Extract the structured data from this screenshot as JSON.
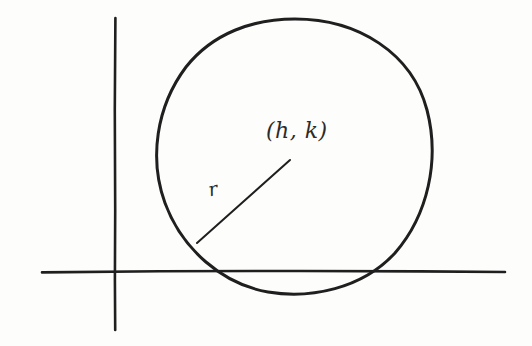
{
  "figure": {
    "background_color": "#fdfdfc",
    "ink_color": "#1f1f1f",
    "width": 532,
    "height": 346
  },
  "labels": {
    "center_point": "(h, k)",
    "radius": "r"
  },
  "chart_data": {
    "type": "scatter",
    "xlabel": "",
    "ylabel": "",
    "axes": {
      "x_axis": {
        "orientation": "horizontal",
        "y_pixel": 271,
        "x_start_pixel": 42,
        "x_end_pixel": 505
      },
      "y_axis": {
        "orientation": "vertical",
        "x_pixel": 115,
        "y_start_pixel": 18,
        "y_end_pixel": 330
      },
      "origin_pixel": [
        115,
        271
      ],
      "grid": false,
      "ticks": [],
      "tick_labels": []
    },
    "shapes": [
      {
        "kind": "circle",
        "center_pixel": [
          294,
          156
        ],
        "radius_pixel": 137,
        "label": "(h, k)",
        "stroke_width": 3,
        "filled": false
      },
      {
        "kind": "segment",
        "name": "radius-segment",
        "from_pixel": [
          197,
          243
        ],
        "to_pixel": [
          290,
          160
        ],
        "label": "r",
        "stroke_width": 2
      }
    ],
    "annotations": [
      {
        "text": "(h, k)",
        "pixel": [
          266,
          118
        ],
        "role": "center-label"
      },
      {
        "text": "r",
        "pixel": [
          206,
          179
        ],
        "role": "radius-label"
      }
    ],
    "legend": null,
    "legend_position": "none"
  }
}
